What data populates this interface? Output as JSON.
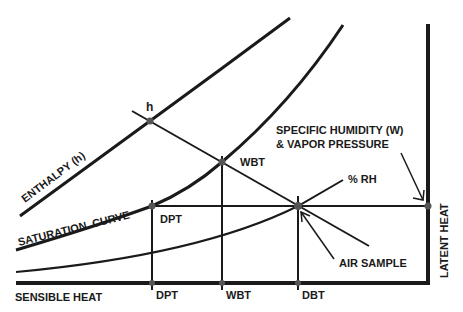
{
  "diagram": {
    "colors": {
      "line": "#1a1a1a",
      "point": "#555555",
      "background": "#ffffff"
    },
    "labels": {
      "enthalpy_curve": "ENTHALPY (h)",
      "saturation_curve": "SATURATION  CURVE",
      "h_point": "h",
      "wbt_point": "WBT",
      "dpt_point": "DPT",
      "rh": "% RH",
      "specific_humidity_line1": "SPECIFIC HUMIDITY (W)",
      "specific_humidity_line2": "& VAPOR PRESSURE",
      "air_sample": "AIR SAMPLE",
      "latent_heat": "LATENT HEAT",
      "sensible_heat": "SENSIBLE HEAT",
      "axis_dpt": "DPT",
      "axis_wbt": "WBT",
      "axis_dbt": "DBT"
    }
  }
}
